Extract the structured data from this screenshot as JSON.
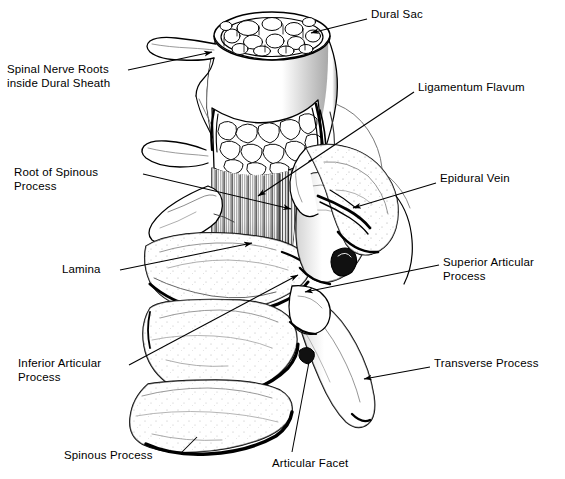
{
  "figure": {
    "style": "black-and-white line drawing with leader lines",
    "background_color": "#ffffff",
    "ink_color": "#000000",
    "width": 565,
    "height": 479
  },
  "labels": [
    {
      "id": "dural-sac",
      "text": "Dural Sac",
      "x": 371,
      "y": 8,
      "align": "left",
      "lines": [
        "Dural Sac"
      ],
      "leader": {
        "from": [
          367,
          19
        ],
        "to": [
          311,
          33
        ],
        "arrow": true
      }
    },
    {
      "id": "spinal-nerve-roots",
      "text": "Spinal Nerve Roots inside Dural Sheath",
      "x": 7,
      "y": 63,
      "align": "left",
      "lines": [
        "Spinal Nerve Roots",
        "inside Dural Sheath"
      ],
      "leader": {
        "from": [
          128,
          70
        ],
        "to": [
          212,
          52
        ],
        "arrow": true
      }
    },
    {
      "id": "ligamentum-flavum",
      "text": "Ligamentum Flavum",
      "x": 418,
      "y": 81,
      "align": "left",
      "lines": [
        "Ligamentum Flavum"
      ],
      "leader": {
        "from": [
          414,
          92
        ],
        "to": [
          258,
          196
        ],
        "arrow": true
      }
    },
    {
      "id": "root-of-spinous-process",
      "text": "Root of Spinous Process",
      "x": 14,
      "y": 166,
      "align": "left",
      "lines": [
        "Root of Spinous",
        "Process"
      ],
      "leader": {
        "from": [
          143,
          174
        ],
        "to": [
          291,
          209
        ],
        "arrow": true
      }
    },
    {
      "id": "epidural-vein",
      "text": "Epidural Vein",
      "x": 440,
      "y": 172,
      "align": "left",
      "lines": [
        "Epidural Vein"
      ],
      "leader": {
        "from": [
          436,
          183
        ],
        "to": [
          353,
          208
        ],
        "arrow": true
      }
    },
    {
      "id": "lamina",
      "text": "Lamina",
      "x": 62,
      "y": 263,
      "align": "left",
      "lines": [
        "Lamina"
      ],
      "leader": {
        "from": [
          120,
          270
        ],
        "to": [
          252,
          243
        ],
        "arrow": true
      }
    },
    {
      "id": "superior-articular-process",
      "text": "Superior Articular Process",
      "x": 443,
      "y": 256,
      "align": "left",
      "lines": [
        "Superior Articular",
        "Process"
      ],
      "leader": {
        "from": [
          439,
          265
        ],
        "to": [
          305,
          292
        ],
        "arrow": true
      }
    },
    {
      "id": "inferior-articular-process",
      "text": "Inferior Articular Process",
      "x": 18,
      "y": 357,
      "align": "left",
      "lines": [
        "Inferior Articular",
        "Process"
      ],
      "leader": {
        "from": [
          129,
          365
        ],
        "to": [
          298,
          275
        ],
        "arrow": true
      }
    },
    {
      "id": "transverse-process",
      "text": "Transverse Process",
      "x": 434,
      "y": 357,
      "align": "left",
      "lines": [
        "Transverse Process"
      ],
      "leader": {
        "from": [
          430,
          367
        ],
        "to": [
          364,
          379
        ],
        "arrow": true
      }
    },
    {
      "id": "spinous-process",
      "text": "Spinous Process",
      "x": 64,
      "y": 449,
      "align": "left",
      "lines": [
        "Spinous Process"
      ],
      "leader": {
        "from": [
          181,
          453
        ],
        "to": [
          197,
          437
        ],
        "arrow": false
      }
    },
    {
      "id": "articular-facet",
      "text": "Articular Facet",
      "x": 272,
      "y": 457,
      "align": "left",
      "lines": [
        "Articular Facet"
      ],
      "leader": {
        "from": [
          292,
          452
        ],
        "to": [
          309,
          362
        ],
        "arrow": false
      }
    }
  ],
  "anatomy_notes": {
    "dural_sac": "cut transverse section at top showing packed nerve root bundles inside the dural sheath",
    "vertebral_body": "vertically striated cut cancellous bone below the dural sac",
    "intervertebral_disc": "irregular cut annulus fibrosus band between dural sac and body",
    "orientation": "posterior-oblique view of a lumbar vertebra"
  }
}
